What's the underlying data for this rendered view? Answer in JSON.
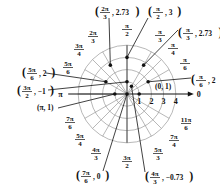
{
  "diagram": {
    "type": "polar-grid",
    "center": {
      "x": 127,
      "y": 94
    },
    "unit_radius_px": 12.2,
    "max_radius": 4,
    "grid_color": "#9a9a9a",
    "axis_color": "#111111",
    "point_color": "#111111",
    "axis_ticks": [
      "1",
      "2",
      "3",
      "4"
    ],
    "axis_end_label": "0",
    "angle_labels": [
      {
        "id": "pi_over_2",
        "num": "π",
        "den": "2",
        "x": 127,
        "y": 28
      },
      {
        "id": "2pi_over_3",
        "num": "2π",
        "den": "3",
        "x": 93,
        "y": 35
      },
      {
        "id": "3pi_over_4",
        "num": "3π",
        "den": "4",
        "x": 79,
        "y": 48
      },
      {
        "id": "5pi_over_6",
        "num": "5π",
        "den": "6",
        "x": 68,
        "y": 66
      },
      {
        "id": "pi_over_3",
        "num": "π",
        "den": "3",
        "x": 160,
        "y": 34
      },
      {
        "id": "pi_over_4",
        "num": "π",
        "den": "4",
        "x": 173,
        "y": 47
      },
      {
        "id": "pi_over_6",
        "num": "π",
        "den": "6",
        "x": 185,
        "y": 62
      },
      {
        "id": "7pi_over_6",
        "num": "7π",
        "den": "6",
        "x": 70,
        "y": 121
      },
      {
        "id": "5pi_over_4",
        "num": "5π",
        "den": "4",
        "x": 80,
        "y": 138
      },
      {
        "id": "4pi_over_3",
        "num": "4π",
        "den": "3",
        "x": 96,
        "y": 152
      },
      {
        "id": "3pi_over_2",
        "num": "3π",
        "den": "2",
        "x": 127,
        "y": 160
      },
      {
        "id": "5pi_over_3",
        "num": "5π",
        "den": "3",
        "x": 158,
        "y": 152
      },
      {
        "id": "7pi_over_4",
        "num": "7π",
        "den": "4",
        "x": 174,
        "y": 139
      },
      {
        "id": "11pi_over_6",
        "num": "11π",
        "den": "6",
        "x": 186,
        "y": 122
      }
    ],
    "pi_label": "π",
    "points": [
      {
        "label_num": "2π",
        "label_den": "3",
        "label_r": "2.73",
        "theta_deg": 120,
        "r": 2.73
      },
      {
        "label_num": "π",
        "label_den": "2",
        "label_r": "3",
        "theta_deg": 90,
        "r": 3
      },
      {
        "label_num": "π",
        "label_den": "3",
        "label_r": "2.73",
        "theta_deg": 60,
        "r": 2.73
      },
      {
        "label_num": "5π",
        "label_den": "6",
        "label_r": "2",
        "theta_deg": 150,
        "r": 2
      },
      {
        "label_num": "π",
        "label_den": "6",
        "label_r": "2",
        "theta_deg": 30,
        "r": 2
      },
      {
        "label_num": "3π",
        "label_den": "2",
        "label_r": "−1",
        "theta_deg": 270,
        "r": -1
      },
      {
        "label_plain": "(π, 1)",
        "theta_deg": 180,
        "r": 1
      },
      {
        "label_plain": "(0, 1)",
        "theta_deg": 0,
        "r": 1
      },
      {
        "label_num": "7π",
        "label_den": "6",
        "label_r": "0",
        "theta_deg": 210,
        "r": 0
      },
      {
        "label_num": "4π",
        "label_den": "3",
        "label_r": "−0.73",
        "theta_deg": 240,
        "r": -0.73
      }
    ],
    "callouts": {
      "p_2pi3": {
        "num": "2π",
        "den": "3",
        "val": "2.73"
      },
      "p_pi2": {
        "num": "π",
        "den": "2",
        "val": "3"
      },
      "p_pi3": {
        "num": "π",
        "den": "3",
        "val": "2.73"
      },
      "p_5pi6": {
        "num": "5π",
        "den": "6",
        "val": "2"
      },
      "p_pi6": {
        "num": "π",
        "den": "6",
        "val": "2"
      },
      "p_3pi2": {
        "num": "3π",
        "den": "2",
        "val": "−1"
      },
      "p_pi1": {
        "text": "(π, 1)"
      },
      "p_01": {
        "text": "(0, 1)"
      },
      "p_7pi6": {
        "num": "7π",
        "den": "6",
        "val": "0"
      },
      "p_4pi3": {
        "num": "4π",
        "den": "3",
        "val": "−0.73"
      }
    }
  }
}
